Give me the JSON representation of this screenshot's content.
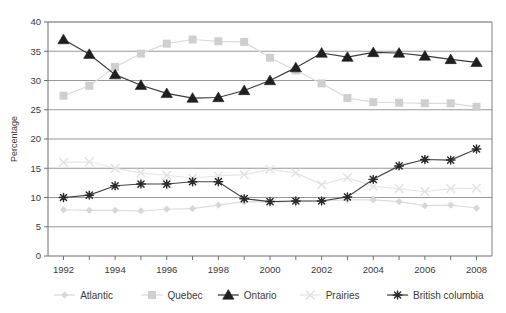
{
  "chart_data": {
    "type": "line",
    "title": "",
    "xlabel": "",
    "ylabel": "Percentage",
    "x": [
      1992,
      1993,
      1994,
      1995,
      1996,
      1997,
      1998,
      1999,
      2000,
      2001,
      2002,
      2003,
      2004,
      2005,
      2006,
      2007,
      2008
    ],
    "xtick_labels": [
      "1992",
      "1994",
      "1996",
      "1998",
      "2000",
      "2002",
      "2004",
      "2006",
      "2008"
    ],
    "xtick_values": [
      1992,
      1994,
      1996,
      1998,
      2000,
      2002,
      2004,
      2006,
      2008
    ],
    "ytick_labels": [
      "0",
      "5",
      "10",
      "15",
      "20",
      "25",
      "30",
      "35",
      "40"
    ],
    "ytick_values": [
      0,
      5,
      10,
      15,
      20,
      25,
      30,
      35,
      40
    ],
    "xlim": [
      1991.4,
      2008.6
    ],
    "ylim": [
      0,
      40
    ],
    "grid": "horizontal",
    "legend_position": "bottom",
    "series": [
      {
        "name": "Atlantic",
        "marker": "diamond",
        "color": "#d7d7d7",
        "line_color": "#dcdcdc",
        "x": [
          1992,
          1993,
          1994,
          1995,
          1996,
          1997,
          1998,
          1999,
          2000,
          2001,
          2002,
          2003,
          2004,
          2005,
          2006,
          2007,
          2008
        ],
        "values": [
          7.9,
          7.8,
          7.8,
          7.7,
          8.0,
          8.1,
          8.7,
          9.3,
          9.2,
          9.3,
          9.4,
          9.6,
          9.6,
          9.3,
          8.6,
          8.7,
          8.2
        ]
      },
      {
        "name": "Quebec",
        "marker": "square",
        "color": "#cfcfcf",
        "line_color": "#dadada",
        "x": [
          1992,
          1993,
          1994,
          1995,
          1996,
          1997,
          1998,
          1999,
          2000,
          2001,
          2002,
          2003,
          2004,
          2005,
          2006,
          2007,
          2008
        ],
        "values": [
          27.4,
          29.1,
          32.3,
          34.6,
          36.3,
          37.0,
          36.7,
          36.6,
          33.9,
          31.7,
          29.5,
          27.0,
          26.3,
          26.2,
          26.1,
          26.1,
          25.5
        ]
      },
      {
        "name": "Ontario",
        "marker": "triangle",
        "color": "#1f1f1f",
        "line_color": "#3c3c3c",
        "x": [
          1992,
          1993,
          1994,
          1995,
          1996,
          1997,
          1998,
          1999,
          2000,
          2001,
          2002,
          2003,
          2004,
          2005,
          2006,
          2007,
          2008
        ],
        "values": [
          37.0,
          34.5,
          31.0,
          29.2,
          27.8,
          27.0,
          27.1,
          28.3,
          30.0,
          32.2,
          34.7,
          34.0,
          34.8,
          34.7,
          34.2,
          33.6,
          33.1
        ]
      },
      {
        "name": "Prairies",
        "marker": "x",
        "color": "#e2e2e2",
        "line_color": "#e6e6e6",
        "x": [
          1992,
          1993,
          1994,
          1995,
          1996,
          1997,
          1998,
          1999,
          2000,
          2001,
          2002,
          2003,
          2004,
          2005,
          2006,
          2007,
          2008
        ],
        "values": [
          16.0,
          16.1,
          15.0,
          14.2,
          13.8,
          13.3,
          13.7,
          13.9,
          14.8,
          14.2,
          12.2,
          13.4,
          11.9,
          11.5,
          11.0,
          11.5,
          11.6
        ]
      },
      {
        "name": "British columbia",
        "marker": "asterisk",
        "color": "#2a2a2a",
        "line_color": "#454545",
        "x": [
          1992,
          1993,
          1994,
          1995,
          1996,
          1997,
          1998,
          1999,
          2000,
          2001,
          2002,
          2003,
          2004,
          2005,
          2006,
          2007,
          2008
        ],
        "values": [
          10.0,
          10.4,
          12.0,
          12.3,
          12.3,
          12.7,
          12.7,
          9.8,
          9.3,
          9.4,
          9.4,
          10.1,
          13.1,
          15.4,
          16.5,
          16.4,
          18.3
        ]
      }
    ]
  },
  "legend": {
    "items": [
      {
        "label": "Atlantic"
      },
      {
        "label": "Quebec"
      },
      {
        "label": "Ontario"
      },
      {
        "label": "Prairies"
      },
      {
        "label": "British columbia"
      }
    ]
  },
  "colors": {
    "grid": "#8d8d8d",
    "axis": "#6f6f6f",
    "text": "#3a3a3a",
    "background": "#ffffff"
  }
}
